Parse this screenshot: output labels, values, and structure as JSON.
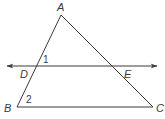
{
  "diagram": {
    "type": "geometry-triangle-with-parallel-line",
    "colors": {
      "stroke": "#3a3a3a",
      "background": "#ffffff"
    },
    "points": {
      "A": {
        "label": "A",
        "x": 61,
        "y": 15
      },
      "B": {
        "label": "B",
        "x": 17,
        "y": 107
      },
      "C": {
        "label": "C",
        "x": 153,
        "y": 107
      },
      "D": {
        "label": "D",
        "x": 36,
        "y": 66
      },
      "E": {
        "label": "E",
        "x": 114,
        "y": 66
      }
    },
    "segments": [
      "AB",
      "AC",
      "BC"
    ],
    "line": {
      "through": [
        "D",
        "E"
      ],
      "arrows": "both"
    },
    "angles": [
      {
        "label": "1",
        "vertex": "D"
      },
      {
        "label": "2",
        "vertex": "B"
      }
    ]
  }
}
